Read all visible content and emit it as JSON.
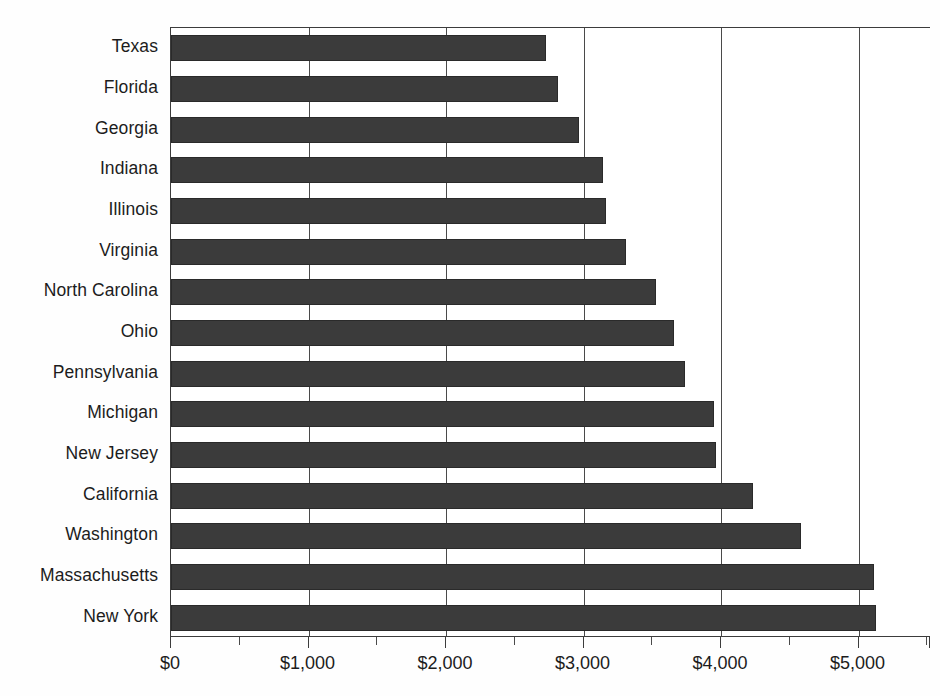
{
  "chart_data": {
    "type": "bar",
    "orientation": "horizontal",
    "title": "",
    "subtitle": "",
    "xlabel": "",
    "ylabel": "",
    "xlim": [
      0,
      5527
    ],
    "grid": "vertical-major-only",
    "legend": "none",
    "bar_color": "#3b3b3b",
    "background_color": "#ffffff",
    "axis_color": "#3c3c3c",
    "categories": [
      "Texas",
      "Florida",
      "Georgia",
      "Indiana",
      "Illinois",
      "Virginia",
      "North Carolina",
      "Ohio",
      "Pennsylvania",
      "Michigan",
      "New Jersey",
      "California",
      "Washington",
      "Massachusetts",
      "New York"
    ],
    "values": [
      2730,
      2815,
      2970,
      3140,
      3160,
      3310,
      3530,
      3660,
      3740,
      3950,
      3960,
      4230,
      4580,
      5110,
      5130
    ],
    "value_prefix": "$",
    "xticks": [
      0,
      1000,
      2000,
      3000,
      4000,
      5000
    ],
    "xtick_labels": [
      "$0",
      "$1,000",
      "$2,000",
      "$3,000",
      "$4,000",
      "$5,000"
    ],
    "xminor_ticks": [
      500,
      1500,
      2500,
      3500,
      4500,
      5500
    ]
  }
}
